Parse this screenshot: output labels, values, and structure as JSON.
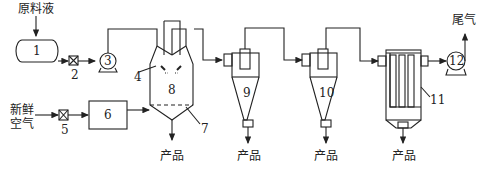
{
  "diagram": {
    "inputs": {
      "raw_liquid": "原料液",
      "fresh_air_line1": "新鲜",
      "fresh_air_line2": "空气"
    },
    "outputs": {
      "exhaust": "尾气",
      "product": "产品"
    },
    "equipment_numbers": [
      "1",
      "2",
      "3",
      "4",
      "5",
      "6",
      "7",
      "8",
      "9",
      "10",
      "11",
      "12"
    ],
    "colors": {
      "line": "#222222",
      "background": "#ffffff"
    }
  }
}
